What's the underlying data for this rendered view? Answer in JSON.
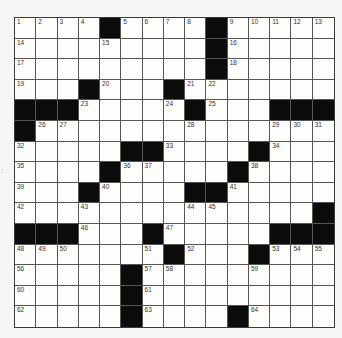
{
  "puzzle": {
    "rows": 15,
    "cols": 15,
    "layout": [
      "....#....#.....",
      ".........#.....",
      ".........#.....",
      "...#...#.......",
      "###.....#...###",
      "#..............",
      ".....##....#...",
      "....#.....#....",
      "...#....##.....",
      "..............#",
      "###...#.....###",
      ".......#...#...",
      ".....#.........",
      ".....#.........",
      ".....#....#...."
    ],
    "numbers": [
      {
        "r": 0,
        "c": 0,
        "n": "1"
      },
      {
        "r": 0,
        "c": 1,
        "n": "2"
      },
      {
        "r": 0,
        "c": 2,
        "n": "3"
      },
      {
        "r": 0,
        "c": 3,
        "n": "4"
      },
      {
        "r": 0,
        "c": 5,
        "n": "5"
      },
      {
        "r": 0,
        "c": 6,
        "n": "6"
      },
      {
        "r": 0,
        "c": 7,
        "n": "7"
      },
      {
        "r": 0,
        "c": 8,
        "n": "8"
      },
      {
        "r": 0,
        "c": 10,
        "n": "9"
      },
      {
        "r": 0,
        "c": 11,
        "n": "10"
      },
      {
        "r": 0,
        "c": 12,
        "n": "11"
      },
      {
        "r": 0,
        "c": 13,
        "n": "12"
      },
      {
        "r": 0,
        "c": 14,
        "n": "13"
      },
      {
        "r": 1,
        "c": 0,
        "n": "14"
      },
      {
        "r": 1,
        "c": 4,
        "n": "15"
      },
      {
        "r": 1,
        "c": 10,
        "n": "16"
      },
      {
        "r": 2,
        "c": 0,
        "n": "17"
      },
      {
        "r": 2,
        "c": 10,
        "n": "18"
      },
      {
        "r": 3,
        "c": 0,
        "n": "19"
      },
      {
        "r": 3,
        "c": 4,
        "n": "20"
      },
      {
        "r": 3,
        "c": 8,
        "n": "21"
      },
      {
        "r": 3,
        "c": 9,
        "n": "22"
      },
      {
        "r": 4,
        "c": 3,
        "n": "23"
      },
      {
        "r": 4,
        "c": 7,
        "n": "24"
      },
      {
        "r": 4,
        "c": 9,
        "n": "25"
      },
      {
        "r": 5,
        "c": 1,
        "n": "26"
      },
      {
        "r": 5,
        "c": 2,
        "n": "27"
      },
      {
        "r": 5,
        "c": 8,
        "n": "28"
      },
      {
        "r": 5,
        "c": 12,
        "n": "29"
      },
      {
        "r": 5,
        "c": 13,
        "n": "30"
      },
      {
        "r": 5,
        "c": 14,
        "n": "31"
      },
      {
        "r": 6,
        "c": 0,
        "n": "32"
      },
      {
        "r": 6,
        "c": 7,
        "n": "33"
      },
      {
        "r": 6,
        "c": 12,
        "n": "34"
      },
      {
        "r": 7,
        "c": 0,
        "n": "35"
      },
      {
        "r": 7,
        "c": 5,
        "n": "36"
      },
      {
        "r": 7,
        "c": 6,
        "n": "37"
      },
      {
        "r": 7,
        "c": 11,
        "n": "38"
      },
      {
        "r": 8,
        "c": 0,
        "n": "39"
      },
      {
        "r": 8,
        "c": 4,
        "n": "40"
      },
      {
        "r": 8,
        "c": 10,
        "n": "41"
      },
      {
        "r": 9,
        "c": 0,
        "n": "42"
      },
      {
        "r": 9,
        "c": 3,
        "n": "43"
      },
      {
        "r": 9,
        "c": 8,
        "n": "44"
      },
      {
        "r": 9,
        "c": 9,
        "n": "45"
      },
      {
        "r": 10,
        "c": 3,
        "n": "46"
      },
      {
        "r": 10,
        "c": 7,
        "n": "47"
      },
      {
        "r": 11,
        "c": 0,
        "n": "48"
      },
      {
        "r": 11,
        "c": 1,
        "n": "49"
      },
      {
        "r": 11,
        "c": 2,
        "n": "50"
      },
      {
        "r": 11,
        "c": 6,
        "n": "51"
      },
      {
        "r": 11,
        "c": 8,
        "n": "52"
      },
      {
        "r": 11,
        "c": 12,
        "n": "53"
      },
      {
        "r": 11,
        "c": 13,
        "n": "54"
      },
      {
        "r": 11,
        "c": 14,
        "n": "55"
      },
      {
        "r": 12,
        "c": 0,
        "n": "56"
      },
      {
        "r": 12,
        "c": 6,
        "n": "57"
      },
      {
        "r": 12,
        "c": 7,
        "n": "58"
      },
      {
        "r": 12,
        "c": 11,
        "n": "59"
      },
      {
        "r": 13,
        "c": 0,
        "n": "60"
      },
      {
        "r": 13,
        "c": 6,
        "n": "61"
      },
      {
        "r": 14,
        "c": 0,
        "n": "62"
      },
      {
        "r": 14,
        "c": 6,
        "n": "63"
      },
      {
        "r": 14,
        "c": 11,
        "n": "64"
      }
    ]
  },
  "margin_mark": ":",
  "colors": {
    "black_cell": "#0c0c0c",
    "white_cell": "#fdfdfb",
    "grid_line": "#555555",
    "background": "#f6f6f4"
  }
}
